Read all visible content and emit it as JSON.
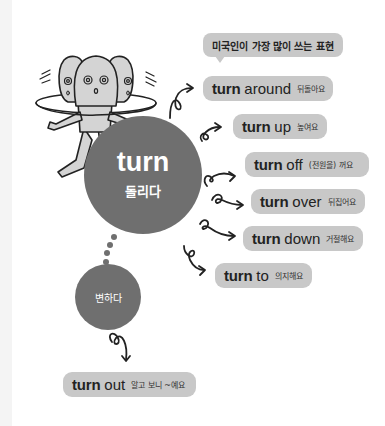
{
  "header": {
    "title": "미국인이 가장 많이 쓰는 표현"
  },
  "main_circle": {
    "word": "turn",
    "meaning": "돌리다"
  },
  "secondary_circle": {
    "meaning": "변하다"
  },
  "phrases": [
    {
      "verb": "turn",
      "particle": "around",
      "meaning": "뒤돌아요"
    },
    {
      "verb": "turn",
      "particle": "up",
      "meaning": "높여요"
    },
    {
      "verb": "turn",
      "particle": "off",
      "meaning": "(전원을) 꺼요"
    },
    {
      "verb": "turn",
      "particle": "over",
      "meaning": "뒤집어요"
    },
    {
      "verb": "turn",
      "particle": "down",
      "meaning": "거절해요"
    },
    {
      "verb": "turn",
      "particle": "to",
      "meaning": "의지해요"
    }
  ],
  "secondary_phrase": {
    "verb": "turn",
    "particle": "out",
    "meaning": "알고 보니 ~예요"
  },
  "colors": {
    "circle": "#6f6f6f",
    "bubble": "#c8c8c8",
    "character": "#d4d4d4",
    "outline": "#222222"
  }
}
